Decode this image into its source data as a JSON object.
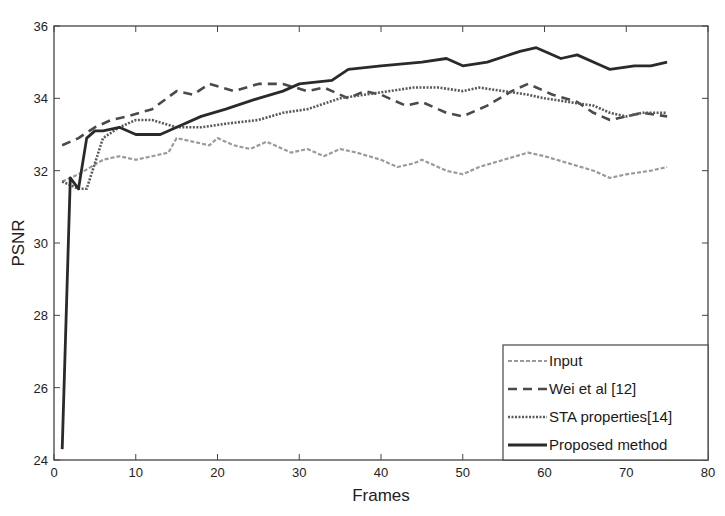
{
  "chart_data": {
    "type": "line",
    "title": "",
    "xlabel": "Frames",
    "ylabel": "PSNR",
    "xlim": [
      0,
      80
    ],
    "ylim": [
      24,
      36
    ],
    "xticks": [
      0,
      10,
      20,
      30,
      40,
      50,
      60,
      70,
      80
    ],
    "yticks": [
      24,
      26,
      28,
      30,
      32,
      34,
      36
    ],
    "grid": false,
    "legend_position": "bottom-right",
    "series": [
      {
        "name": "Input",
        "style": "dash-dot",
        "color": "#9a9a9a",
        "x": [
          1,
          3,
          6,
          8,
          10,
          12,
          14,
          15,
          17,
          19,
          20,
          22,
          24,
          26,
          29,
          31,
          33,
          35,
          37,
          40,
          42,
          44,
          45,
          48,
          50,
          52,
          55,
          58,
          60,
          63,
          66,
          68,
          70,
          73,
          75
        ],
        "y": [
          31.7,
          31.9,
          32.3,
          32.4,
          32.3,
          32.4,
          32.5,
          32.9,
          32.8,
          32.7,
          32.9,
          32.7,
          32.6,
          32.8,
          32.5,
          32.6,
          32.4,
          32.6,
          32.5,
          32.3,
          32.1,
          32.2,
          32.3,
          32.0,
          31.9,
          32.1,
          32.3,
          32.5,
          32.4,
          32.2,
          32.0,
          31.8,
          31.9,
          32.0,
          32.1
        ]
      },
      {
        "name": "Wei et al [12]",
        "style": "dashed",
        "color": "#4a4a4a",
        "x": [
          1,
          3,
          5,
          7,
          9,
          12,
          15,
          17,
          19,
          22,
          25,
          28,
          31,
          33,
          36,
          38,
          40,
          43,
          45,
          48,
          50,
          53,
          56,
          58,
          61,
          64,
          66,
          68,
          70,
          72,
          75
        ],
        "y": [
          32.7,
          32.9,
          33.2,
          33.4,
          33.5,
          33.7,
          34.2,
          34.1,
          34.4,
          34.2,
          34.4,
          34.4,
          34.2,
          34.3,
          34.0,
          34.2,
          34.1,
          33.8,
          33.9,
          33.6,
          33.5,
          33.8,
          34.2,
          34.4,
          34.1,
          33.9,
          33.6,
          33.4,
          33.5,
          33.6,
          33.5
        ]
      },
      {
        "name": "STA properties[14]",
        "style": "dotted",
        "color": "#5a5a5a",
        "x": [
          1,
          3,
          4,
          6,
          8,
          10,
          12,
          15,
          18,
          21,
          25,
          28,
          31,
          35,
          38,
          41,
          44,
          47,
          50,
          52,
          55,
          58,
          60,
          63,
          66,
          68,
          70,
          72,
          75
        ],
        "y": [
          31.7,
          31.5,
          31.5,
          32.9,
          33.2,
          33.4,
          33.4,
          33.2,
          33.2,
          33.3,
          33.4,
          33.6,
          33.7,
          34.0,
          34.1,
          34.2,
          34.3,
          34.3,
          34.2,
          34.3,
          34.2,
          34.1,
          34.0,
          33.9,
          33.8,
          33.6,
          33.5,
          33.6,
          33.6
        ]
      },
      {
        "name": "Proposed method",
        "style": "solid",
        "color": "#2a2a2a",
        "x": [
          1,
          2,
          3,
          4,
          5,
          6,
          8,
          10,
          13,
          15,
          18,
          21,
          25,
          28,
          30,
          34,
          36,
          40,
          45,
          48,
          50,
          53,
          57,
          59,
          62,
          64,
          67,
          68,
          71,
          73,
          75
        ],
        "y": [
          24.3,
          31.8,
          31.5,
          32.9,
          33.1,
          33.1,
          33.2,
          33.0,
          33.0,
          33.2,
          33.5,
          33.7,
          34.0,
          34.2,
          34.4,
          34.5,
          34.8,
          34.9,
          35.0,
          35.1,
          34.9,
          35.0,
          35.3,
          35.4,
          35.1,
          35.2,
          34.9,
          34.8,
          34.9,
          34.9,
          35.0
        ]
      }
    ]
  }
}
